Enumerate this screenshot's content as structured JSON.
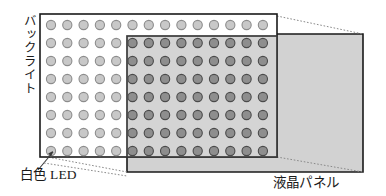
{
  "diagram": {
    "labels": {
      "backlight": "バックライト",
      "white_led": "白色 LED",
      "lcd_panel": "液晶パネル"
    },
    "colors": {
      "outline": "#1a1a1a",
      "backlight_fill": "#ffffff",
      "panel_fill": "#d2d2d2",
      "led_outside_fill": "#c8c8c8",
      "led_outside_stroke": "#8c8c8c",
      "led_inside_fill": "#8e8e8e",
      "led_inside_stroke": "#4a4a4a",
      "leader_line": "#555555",
      "dotted_line": "#8a8a8a"
    },
    "backlight_panel": {
      "x": 40,
      "y": 14,
      "width": 237,
      "height": 143,
      "led_grid": {
        "columns": 14,
        "rows": 8,
        "led_radius": 4.6,
        "col_spacing": 16.3,
        "row_spacing": 18.0,
        "origin_x": 51,
        "origin_y": 25
      }
    },
    "lcd_panel": {
      "front_face": {
        "x": 127,
        "y": 36,
        "width": 150,
        "height": 121
      },
      "projected_face": {
        "x": 127,
        "y": 34,
        "width": 236,
        "height": 138
      },
      "covered_leds": {
        "columns": 9,
        "rows": 7
      }
    },
    "leader_lines": [
      {
        "name": "led-callout",
        "from_x": 38,
        "from_y": 170,
        "to_x": 53,
        "to_y": 152
      }
    ],
    "projection_lines": [
      {
        "name": "top-left-projection",
        "x1": 42,
        "y1": 16,
        "x2": 127,
        "y2": 35
      },
      {
        "name": "top-right-projection",
        "x1": 277,
        "y1": 16,
        "x2": 363,
        "y2": 34
      },
      {
        "name": "bottom-left-projection",
        "x1": 42,
        "y1": 156,
        "x2": 127,
        "y2": 172
      },
      {
        "name": "bottom-right-projection",
        "x1": 277,
        "y1": 157,
        "x2": 363,
        "y2": 172
      }
    ]
  }
}
